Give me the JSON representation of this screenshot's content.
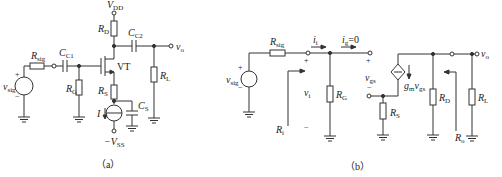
{
  "figure_a": {
    "caption": "（a）",
    "labels": {
      "vdd": {
        "main": "V",
        "sub": "DD"
      },
      "rd": {
        "main": "R",
        "sub": "D"
      },
      "cc2": {
        "main": "C",
        "sub": "C2"
      },
      "vo": {
        "main": "v",
        "sub": "o"
      },
      "rsig": {
        "main": "R",
        "sub": "sig"
      },
      "cc1": {
        "main": "C",
        "sub": "C1"
      },
      "vt": "VT",
      "rl": {
        "main": "R",
        "sub": "L"
      },
      "vsig": {
        "main": "v",
        "sub": "sig"
      },
      "rg": {
        "main": "R",
        "sub": "G"
      },
      "rs": {
        "main": "R",
        "sub": "S"
      },
      "cs": {
        "main": "C",
        "sub": "S"
      },
      "i": "I",
      "vss": {
        "main": "−V",
        "sub": "SS"
      },
      "plus": "+",
      "minus": "−"
    }
  },
  "figure_b": {
    "caption": "（b）",
    "labels": {
      "rsig": {
        "main": "R",
        "sub": "sig"
      },
      "ii": {
        "main": "i",
        "sub": "i"
      },
      "ig": {
        "main": "i",
        "sub": "g",
        "tail": "=0"
      },
      "vo": {
        "main": "v",
        "sub": "o"
      },
      "vsig": {
        "main": "v",
        "sub": "sig"
      },
      "vi": {
        "main": "v",
        "sub": "i"
      },
      "rg": {
        "main": "R",
        "sub": "G"
      },
      "vgs": {
        "main": "v",
        "sub": "gs"
      },
      "gmvgs": {
        "main": "g",
        "sub": "m",
        "main2": "v",
        "sub2": "gs"
      },
      "rs": {
        "main": "R",
        "sub": "S"
      },
      "rd": {
        "main": "R",
        "sub": "D"
      },
      "rl": {
        "main": "R",
        "sub": "L"
      },
      "ri": {
        "main": "R",
        "sub": "i"
      },
      "ro": {
        "main": "R",
        "sub": "o"
      },
      "plus": "+",
      "minus": "−"
    }
  }
}
